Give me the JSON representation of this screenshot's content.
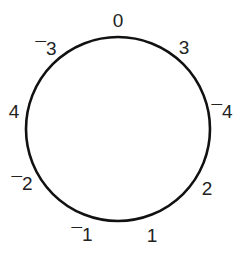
{
  "diagram": {
    "type": "clock-number-circle",
    "circle": {
      "cx": 118,
      "cy": 129,
      "r": 92,
      "stroke": "#111111",
      "stroke_width": 2.6
    },
    "labels": [
      {
        "text": "0",
        "x": 118,
        "y": 27
      },
      {
        "text": "3",
        "x": 184,
        "y": 54
      },
      {
        "text": "¯4",
        "x": 222,
        "y": 118
      },
      {
        "text": "2",
        "x": 207,
        "y": 195
      },
      {
        "text": "1",
        "x": 152,
        "y": 242
      },
      {
        "text": "¯1",
        "x": 82,
        "y": 241
      },
      {
        "text": "¯2",
        "x": 22,
        "y": 190
      },
      {
        "text": "4",
        "x": 14,
        "y": 118
      },
      {
        "text": "¯3",
        "x": 46,
        "y": 55
      }
    ]
  }
}
